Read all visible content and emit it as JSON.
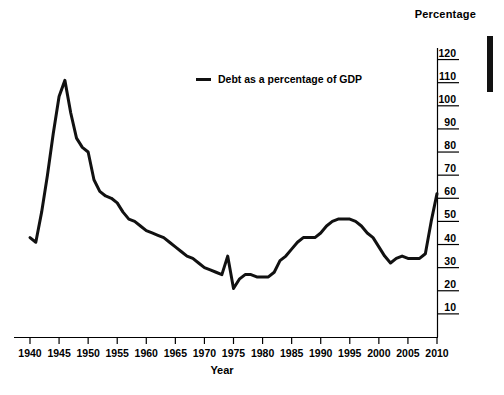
{
  "chart_data": {
    "type": "line",
    "title": "",
    "xlabel": "Year",
    "ylabel": "Percentage",
    "xlim": [
      1940,
      2010
    ],
    "ylim": [
      0,
      120
    ],
    "grid": false,
    "legend_position": "top-center",
    "y_axis_side": "right",
    "xticks": [
      1940,
      1945,
      1950,
      1955,
      1960,
      1965,
      1970,
      1975,
      1980,
      1985,
      1990,
      1995,
      2000,
      2005,
      2010
    ],
    "xticklabels": [
      "1940",
      "1945",
      "1950",
      "1955",
      "1960",
      "1965",
      "1970",
      "1975",
      "1980",
      "1985",
      "1990",
      "1995",
      "2000",
      "2005",
      "2010"
    ],
    "yticks": [
      10,
      20,
      30,
      40,
      50,
      60,
      70,
      80,
      90,
      100,
      110,
      120
    ],
    "yticklabels": [
      "10",
      "20",
      "30",
      "40",
      "50",
      "60",
      "70",
      "80",
      "90",
      "100",
      "110",
      "120"
    ],
    "series": [
      {
        "name": "Debt as a percentage of GDP",
        "color": "#111111",
        "x": [
          1940,
          1941,
          1942,
          1943,
          1944,
          1945,
          1946,
          1947,
          1948,
          1949,
          1950,
          1951,
          1952,
          1953,
          1954,
          1955,
          1956,
          1957,
          1958,
          1959,
          1960,
          1961,
          1962,
          1963,
          1964,
          1965,
          1966,
          1967,
          1968,
          1969,
          1970,
          1971,
          1972,
          1973,
          1974,
          1975,
          1976,
          1977,
          1978,
          1979,
          1980,
          1981,
          1982,
          1983,
          1984,
          1985,
          1986,
          1987,
          1988,
          1989,
          1990,
          1991,
          1992,
          1993,
          1994,
          1995,
          1996,
          1997,
          1998,
          1999,
          2000,
          2001,
          2002,
          2003,
          2004,
          2005,
          2006,
          2007,
          2008,
          2009,
          2010
        ],
        "y": [
          43,
          41,
          54,
          70,
          88,
          104,
          111,
          97,
          86,
          82,
          80,
          68,
          63,
          61,
          60,
          58,
          54,
          51,
          50,
          48,
          46,
          45,
          44,
          43,
          41,
          39,
          37,
          35,
          34,
          32,
          30,
          29,
          28,
          27,
          35,
          21,
          25,
          27,
          27,
          26,
          26,
          26,
          28,
          33,
          35,
          38,
          41,
          43,
          43,
          43,
          45,
          48,
          50,
          51,
          51,
          51,
          50,
          48,
          45,
          43,
          39,
          35,
          32,
          34,
          35,
          34,
          34,
          34,
          36,
          50,
          62
        ]
      }
    ],
    "annotations": []
  },
  "axes": {
    "y_title": "Percentage",
    "x_title": "Year"
  },
  "legend": {
    "entries": [
      {
        "label": "Debt as a percentage of GDP",
        "color": "#111111"
      }
    ]
  },
  "decoration": {
    "side_bar_color": "#111111"
  }
}
